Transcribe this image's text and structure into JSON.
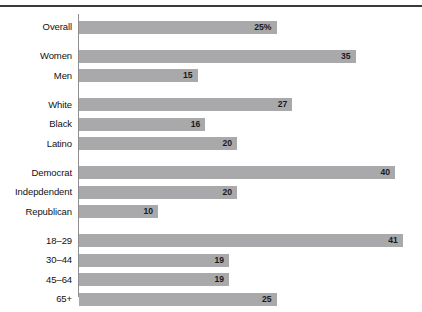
{
  "chart_data": {
    "type": "bar",
    "orientation": "horizontal",
    "title": "",
    "subtitle": "",
    "xlabel": "",
    "ylabel": "",
    "xlim": [
      0,
      43
    ],
    "grid": false,
    "legend": null,
    "value_suffix_first_bar": "%",
    "categories": [
      "Overall",
      "Women",
      "Men",
      "White",
      "Black",
      "Latino",
      "Democrat",
      "Indepdendent",
      "Republican",
      "18–29",
      "30–44",
      "45–64",
      "65+"
    ],
    "values": [
      25,
      35,
      15,
      27,
      16,
      20,
      40,
      20,
      10,
      41,
      19,
      19,
      25
    ],
    "value_labels": [
      "25%",
      "35",
      "15",
      "27",
      "16",
      "20",
      "40",
      "20",
      "10",
      "41",
      "19",
      "19",
      "25"
    ],
    "groups": [
      {
        "name": "total",
        "categories": [
          "Overall"
        ]
      },
      {
        "name": "gender",
        "categories": [
          "Women",
          "Men"
        ]
      },
      {
        "name": "race",
        "categories": [
          "White",
          "Black",
          "Latino"
        ]
      },
      {
        "name": "party",
        "categories": [
          "Democrat",
          "Indepdendent",
          "Republican"
        ]
      },
      {
        "name": "age",
        "categories": [
          "18–29",
          "30–44",
          "45–64",
          "65+"
        ]
      }
    ],
    "bar_color": "#a9a9ab",
    "axis_color": "#8e8e90",
    "rule_color": "#3a3a3c",
    "background_color": "#ffffff"
  }
}
